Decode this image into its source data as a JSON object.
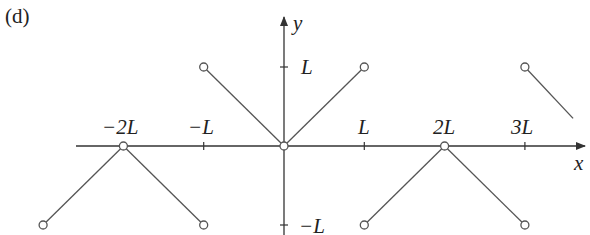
{
  "figure": {
    "panel_label": "(d)",
    "x_axis_label": "x",
    "y_axis_label": "y",
    "x_ticks": [
      {
        "value": -2,
        "label": "−2L"
      },
      {
        "value": -1,
        "label": "−L"
      },
      {
        "value": 1,
        "label": "L"
      },
      {
        "value": 2,
        "label": "2L"
      },
      {
        "value": 3,
        "label": "3L"
      }
    ],
    "y_ticks": [
      {
        "value": 1,
        "label": "L"
      },
      {
        "value": -1,
        "label": "−L"
      }
    ],
    "segments": [
      {
        "from": [
          -3,
          -1
        ],
        "to": [
          -2,
          0
        ],
        "open_start": true,
        "open_end": true
      },
      {
        "from": [
          -2,
          0
        ],
        "to": [
          -1,
          -1
        ],
        "open_start": true,
        "open_end": true
      },
      {
        "from": [
          -1,
          1
        ],
        "to": [
          0,
          0
        ],
        "open_start": true,
        "open_end": true
      },
      {
        "from": [
          0,
          0
        ],
        "to": [
          1,
          1
        ],
        "open_start": true,
        "open_end": true
      },
      {
        "from": [
          1,
          -1
        ],
        "to": [
          2,
          0
        ],
        "open_start": true,
        "open_end": true
      },
      {
        "from": [
          2,
          0
        ],
        "to": [
          3,
          -1
        ],
        "open_start": true,
        "open_end": true
      },
      {
        "from": [
          3,
          1
        ],
        "to": [
          3.6,
          0.35
        ],
        "open_start": true,
        "open_end": false
      }
    ],
    "line_color": "#555555",
    "axis_color": "#333333"
  }
}
